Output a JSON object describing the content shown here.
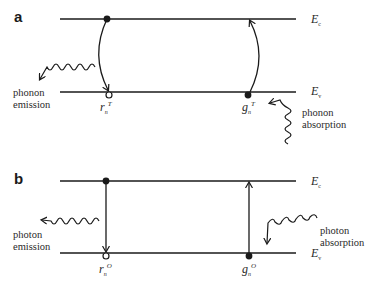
{
  "panels": [
    {
      "label": "a",
      "upper_level": {
        "symbol": "E",
        "subscript": "c"
      },
      "lower_level": {
        "symbol": "E",
        "subscript": "v"
      },
      "left_process": {
        "line1": "phonon",
        "line2": "emission"
      },
      "right_process": {
        "line1": "phonon",
        "line2": "absorption"
      },
      "left_rate": {
        "symbol": "r",
        "subscript": "n",
        "superscript": "T"
      },
      "right_rate": {
        "symbol": "g",
        "subscript": "n",
        "superscript": "T"
      }
    },
    {
      "label": "b",
      "upper_level": {
        "symbol": "E",
        "subscript": "c"
      },
      "lower_level": {
        "symbol": "E",
        "subscript": "v"
      },
      "left_process": {
        "line1": "photon",
        "line2": "emission"
      },
      "right_process": {
        "line1": "photon",
        "line2": "absorption"
      },
      "left_rate": {
        "symbol": "r",
        "subscript": "n",
        "superscript": "O"
      },
      "right_rate": {
        "symbol": "g",
        "subscript": "n",
        "superscript": "O"
      }
    }
  ],
  "colors": {
    "line": "#1a1a1a",
    "text": "#2a2a2a",
    "background": "#ffffff"
  }
}
